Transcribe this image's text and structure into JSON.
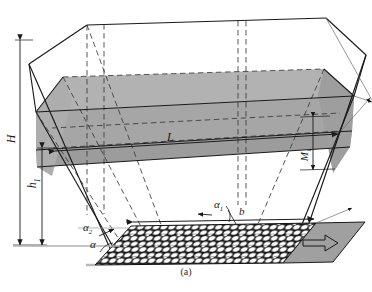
{
  "figure": {
    "caption": "(a)",
    "colors": {
      "shade_gray": "#a6a6a6",
      "shade_gray_dark": "#9a9a9a",
      "shade_gray_light": "#b4b4b4",
      "apron_gray": "#a0a0a0",
      "line": "#1a1a1a",
      "paper": "#ffffff",
      "dash": "#3a3a3a"
    }
  },
  "labels": {
    "height_total": "H",
    "height_water": "h",
    "height_water_sub": "1",
    "length": "L",
    "thickness": "M",
    "thickness_sub": "1",
    "bed_width": "b",
    "angle_bank": "α",
    "angle_top": "α",
    "angle_top_sub": "1",
    "angle_mid": "α",
    "angle_mid_sub": "2"
  },
  "elements": {
    "prism": "trapezoidal-channel-prism",
    "water_layer": "shaded-water-layer",
    "riprap_bed": "gravel-riprap-bed",
    "flow_apron": "flow-direction-apron",
    "flow_arrow": "flow-direction-arrow"
  },
  "riprap": {
    "rows": 7,
    "cols": 22,
    "stone_fill": "#ffffff",
    "gap_fill": "#111111"
  }
}
